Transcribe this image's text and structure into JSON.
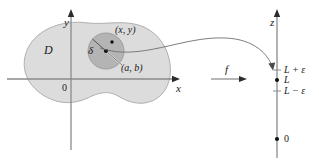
{
  "figure": {
    "colors": {
      "domain_fill": "#dcdcdc",
      "delta_fill": "#b4b4b4",
      "outline": "#9a9a9a",
      "axis": "#8a8a8a",
      "ink": "#1a1a1a"
    }
  },
  "domain_plot": {
    "region_label": "D",
    "y_axis_label": "y",
    "x_axis_label": "x",
    "origin_label": "0",
    "delta_label": "δ",
    "point_xy_label": "(x, y)",
    "point_ab_label": "(a, b)"
  },
  "mapping": {
    "function_label": "f"
  },
  "range_axis": {
    "z_axis_label": "z",
    "upper_label": "L + ε",
    "center_label": "L",
    "lower_label": "L − ε",
    "origin_label": "0"
  }
}
